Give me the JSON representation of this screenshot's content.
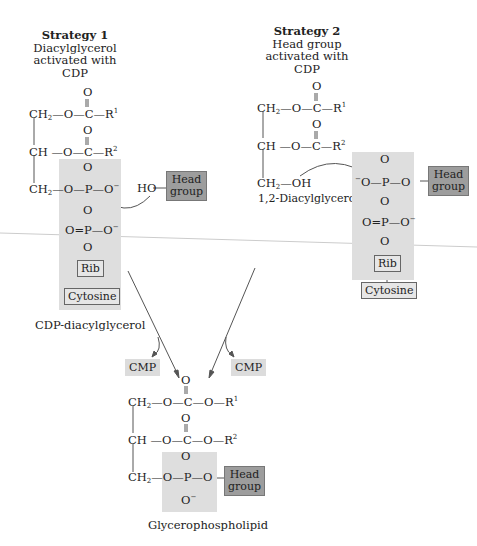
{
  "strategy1": {
    "title": "Strategy 1",
    "desc1": "Diacylglycerol",
    "desc2": "activated with",
    "desc3": "CDP",
    "label": "CDP-diacylglycerol",
    "reactant": "HO",
    "head_group_1": "Head",
    "head_group_2": "group",
    "rib": "Rib",
    "cytosine": "Cytosine"
  },
  "strategy2": {
    "title": "Strategy 2",
    "desc1": "Head group",
    "desc2": "activated with",
    "desc3": "CDP",
    "label": "1,2-Diacylglycerol",
    "head_group_1": "Head",
    "head_group_2": "group",
    "rib": "Rib",
    "cytosine": "Cytosine"
  },
  "byproducts": {
    "left": "CMP",
    "right": "CMP"
  },
  "product": {
    "label": "Glycerophospholipid",
    "head_group_1": "Head",
    "head_group_2": "group"
  },
  "colors": {
    "shade": "#dedede",
    "head_group": "#9d9d9d",
    "line": "#555555"
  }
}
